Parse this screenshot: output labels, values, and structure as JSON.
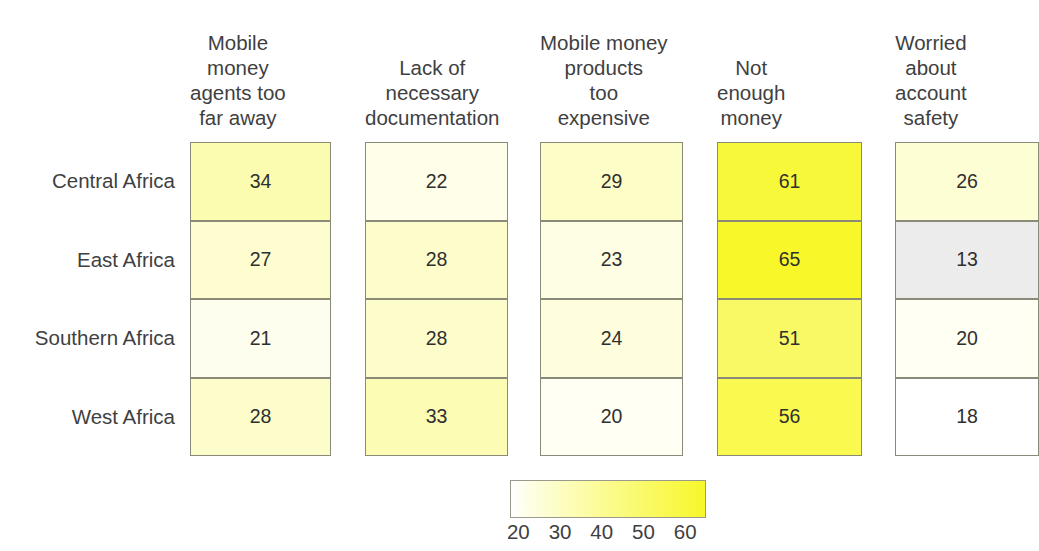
{
  "chart_data": {
    "type": "heatmap",
    "title": "",
    "xlabel": "",
    "ylabel": "",
    "categories_x": [
      "Mobile money agents too far away",
      "Lack of necessary documentation",
      "Mobile money products too expensive",
      "Not enough money",
      "Worried about account safety"
    ],
    "categories_y": [
      "Central Africa",
      "East Africa",
      "Southern Africa",
      "West Africa"
    ],
    "values": [
      [
        34,
        22,
        29,
        61,
        26
      ],
      [
        27,
        28,
        23,
        65,
        13
      ],
      [
        21,
        28,
        24,
        51,
        20
      ],
      [
        28,
        33,
        20,
        56,
        18
      ]
    ],
    "colorbar": {
      "ticks": [
        20,
        30,
        40,
        50,
        60
      ],
      "vmin": 18,
      "vmax": 65,
      "low_color": "#ffffff",
      "high_color": "#f7f72a",
      "orientation": "horizontal"
    },
    "grid": false,
    "legend_position": "bottom-center"
  },
  "columns": [
    {
      "label": "Mobile\nmoney\nagents too\nfar away"
    },
    {
      "label": "Lack of\nnecessary\ndocumentation"
    },
    {
      "label": "Mobile money\nproducts\ntoo\nexpensive"
    },
    {
      "label": "Not\nenough\nmoney"
    },
    {
      "label": "Worried\nabout\naccount\nsafety"
    }
  ],
  "rows": [
    {
      "label": "Central Africa"
    },
    {
      "label": "East Africa"
    },
    {
      "label": "Southern Africa"
    },
    {
      "label": "West Africa"
    }
  ],
  "cells": {
    "r0": [
      "34",
      "22",
      "29",
      "61",
      "26"
    ],
    "r1": [
      "27",
      "28",
      "23",
      "65",
      "13"
    ],
    "r2": [
      "21",
      "28",
      "24",
      "51",
      "20"
    ],
    "r3": [
      "28",
      "33",
      "20",
      "56",
      "18"
    ]
  },
  "colorbar_ticks": [
    "20",
    "30",
    "40",
    "50",
    "60"
  ]
}
